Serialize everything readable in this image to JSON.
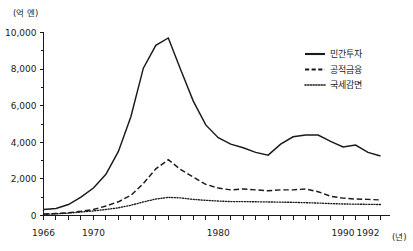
{
  "chart_data": {
    "type": "line",
    "title": "",
    "subtitle": "",
    "xlabel": "(년)",
    "ylabel": "(억 엔)",
    "xlim": [
      1966,
      1993
    ],
    "ylim": [
      0,
      10000
    ],
    "grid": false,
    "legend_position": "right-top",
    "y_unit_label": "(억 엔)",
    "x_unit_label": "(년)",
    "y_ticks_major": [
      0,
      2000,
      4000,
      6000,
      8000,
      10000
    ],
    "y_ticks_major_labels": [
      "0",
      "2,000",
      "4,000",
      "6,000",
      "8,000",
      "10,000"
    ],
    "y_ticks_minor": [
      1000,
      3000,
      5000,
      7000,
      9000
    ],
    "x_ticks": [
      1966,
      1967,
      1968,
      1969,
      1970,
      1971,
      1972,
      1973,
      1974,
      1975,
      1976,
      1977,
      1978,
      1979,
      1980,
      1981,
      1982,
      1983,
      1984,
      1985,
      1986,
      1987,
      1988,
      1989,
      1990,
      1991,
      1992,
      1993
    ],
    "x_tick_labels": [
      {
        "year": 1966,
        "label": "1966"
      },
      {
        "year": 1970,
        "label": "1970"
      },
      {
        "year": 1980,
        "label": "1980"
      },
      {
        "year": 1990,
        "label": "1990"
      },
      {
        "year": 1992,
        "label": "1992"
      }
    ],
    "x": [
      1966,
      1967,
      1968,
      1969,
      1970,
      1971,
      1972,
      1973,
      1974,
      1975,
      1976,
      1977,
      1978,
      1979,
      1980,
      1981,
      1982,
      1983,
      1984,
      1985,
      1986,
      1987,
      1988,
      1989,
      1990,
      1991,
      1992,
      1993
    ],
    "series": [
      {
        "name": "민간투자",
        "style": "solid",
        "color": "#1a1a1a",
        "values": [
          330,
          380,
          600,
          1000,
          1500,
          2250,
          3500,
          5400,
          8050,
          9300,
          9700,
          7950,
          6250,
          4950,
          4250,
          3900,
          3700,
          3450,
          3300,
          3900,
          4300,
          4400,
          4400,
          4050,
          3750,
          3850,
          3450,
          3250
        ]
      },
      {
        "name": "공적금융",
        "style": "dashed",
        "color": "#1a1a1a",
        "values": [
          80,
          110,
          150,
          230,
          330,
          520,
          750,
          1100,
          1750,
          2550,
          3050,
          2500,
          2100,
          1700,
          1500,
          1400,
          1450,
          1400,
          1350,
          1400,
          1400,
          1450,
          1300,
          1050,
          950,
          900,
          880,
          850
        ]
      },
      {
        "name": "국세감면",
        "style": "dotted",
        "color": "#1a1a1a",
        "values": [
          60,
          90,
          130,
          190,
          250,
          330,
          420,
          560,
          740,
          900,
          990,
          960,
          880,
          830,
          790,
          760,
          760,
          750,
          740,
          730,
          720,
          700,
          680,
          650,
          630,
          620,
          610,
          600
        ]
      }
    ]
  },
  "legend": {
    "items": [
      {
        "label": "민간투자",
        "style": "solid"
      },
      {
        "label": "공적금융",
        "style": "dashed"
      },
      {
        "label": "국세감면",
        "style": "dotted"
      }
    ]
  }
}
